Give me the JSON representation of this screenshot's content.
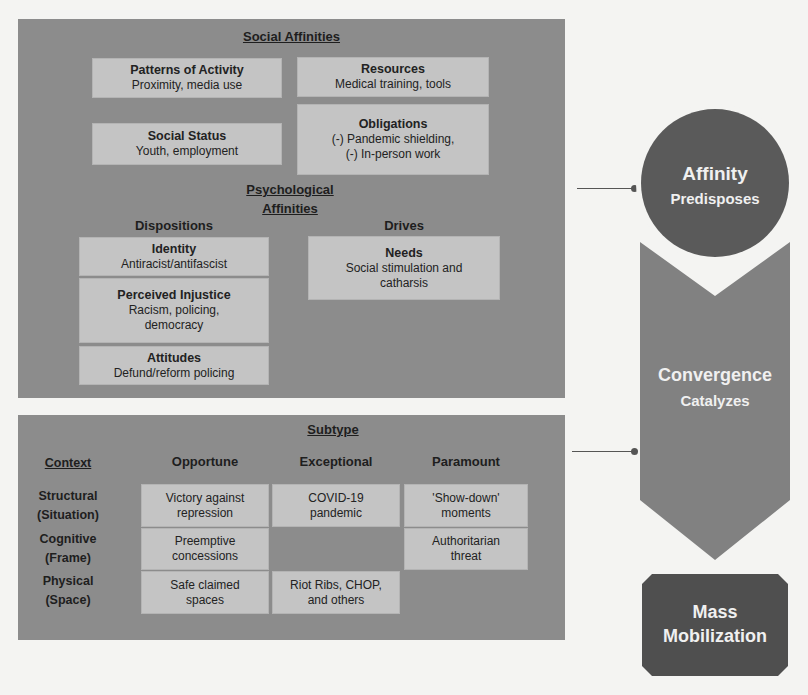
{
  "social_affinities": {
    "heading": "Social Affinities",
    "boxes": [
      {
        "title": "Patterns of Activity",
        "body": "Proximity, media use"
      },
      {
        "title": "Resources",
        "body": "Medical training, tools"
      },
      {
        "title": "Social Status",
        "body": "Youth, employment"
      },
      {
        "title": "Obligations",
        "body_line1": "(-) Pandemic shielding,",
        "body_line2": "(-) In-person work"
      }
    ]
  },
  "psychological_affinities": {
    "heading_line1": "Psychological",
    "heading_line2": "Affinities",
    "dispositions": {
      "label": "Dispositions",
      "boxes": [
        {
          "title": "Identity",
          "body": "Antiracist/antifascist"
        },
        {
          "title": "Perceived Injustice",
          "body_line1": "Racism, policing,",
          "body_line2": "democracy"
        },
        {
          "title": "Attitudes",
          "body": "Defund/reform policing"
        }
      ]
    },
    "drives": {
      "label": "Drives",
      "boxes": [
        {
          "title": "Needs",
          "body_line1": "Social stimulation and",
          "body_line2": "catharsis"
        }
      ]
    }
  },
  "subtype": {
    "heading": "Subtype",
    "context_heading": "Context",
    "columns": [
      "Opportune",
      "Exceptional",
      "Paramount"
    ],
    "rows": [
      {
        "label_line1": "Structural",
        "label_line2": "(Situation)"
      },
      {
        "label_line1": "Cognitive",
        "label_line2": "(Frame)"
      },
      {
        "label_line1": "Physical",
        "label_line2": "(Space)"
      }
    ],
    "cells": {
      "structural_opportune": {
        "line1": "Victory against",
        "line2": "repression"
      },
      "structural_exceptional": {
        "line1": "COVID-19",
        "line2": "pandemic"
      },
      "structural_paramount": {
        "line1": "'Show-down'",
        "line2": "moments"
      },
      "cognitive_opportune": {
        "line1": "Preemptive",
        "line2": "concessions"
      },
      "cognitive_paramount": {
        "line1": "Authoritarian",
        "line2": "threat"
      },
      "physical_opportune": {
        "line1": "Safe claimed",
        "line2": "spaces"
      },
      "physical_exceptional": {
        "line1": "Riot Ribs, CHOP,",
        "line2": "and others"
      }
    }
  },
  "process": {
    "affinity": {
      "title": "Affinity",
      "subtitle": "Predisposes"
    },
    "convergence": {
      "title": "Convergence",
      "subtitle": "Catalyzes"
    },
    "mobilization": {
      "line1": "Mass",
      "line2": "Mobilization"
    }
  },
  "colors": {
    "panel": "#8c8c8c",
    "box": "#c4c4c4",
    "circle": "#5a5a5a",
    "chevron": "#818181",
    "mobilization": "#4f4f4f",
    "background": "#f4f4f2"
  }
}
